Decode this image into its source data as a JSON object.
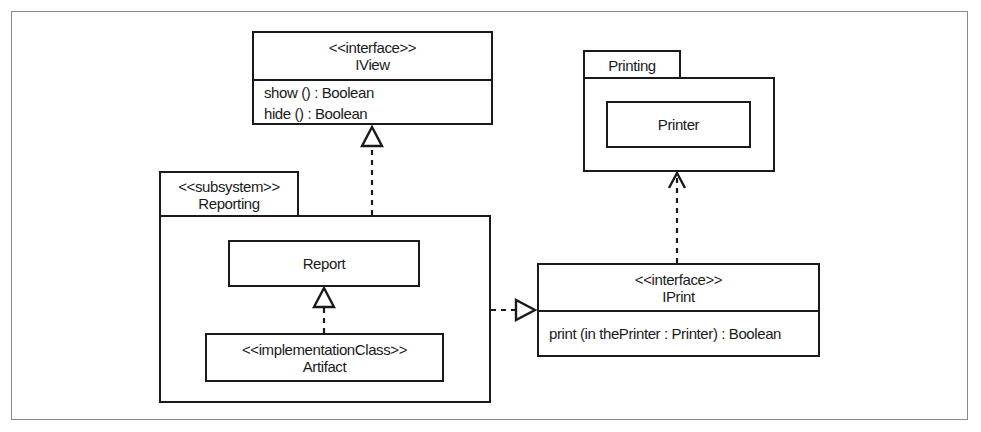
{
  "diagram": {
    "type": "UML class/package diagram",
    "iview": {
      "stereotype": "<<interface>>",
      "name": "IView",
      "operations": [
        "show () : Boolean",
        "hide () : Boolean"
      ]
    },
    "printing_package": {
      "name": "Printing",
      "classes": [
        {
          "name": "Printer"
        }
      ]
    },
    "reporting_package": {
      "stereotype": "<<subsystem>>",
      "name": "Reporting",
      "report": {
        "name": "Report"
      },
      "artifact": {
        "stereotype": "<<implementationClass>>",
        "name": "Artifact"
      }
    },
    "iprint": {
      "stereotype": "<<interface>>",
      "name": "IPrint",
      "operations": [
        "print (in thePrinter : Printer) : Boolean"
      ]
    },
    "relationships": [
      {
        "from": "Reporting",
        "to": "IView",
        "kind": "realization"
      },
      {
        "from": "Artifact",
        "to": "Report",
        "kind": "realization"
      },
      {
        "from": "Reporting",
        "to": "IPrint",
        "kind": "realization"
      },
      {
        "from": "IPrint",
        "to": "Printing",
        "kind": "dependency"
      }
    ]
  }
}
